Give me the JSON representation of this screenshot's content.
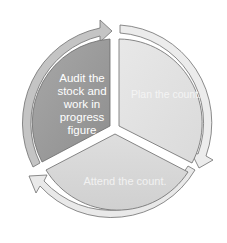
{
  "diagram": {
    "type": "cycle",
    "segments": [
      {
        "id": "audit",
        "label": "Audit the stock and work in progress figure",
        "lines": [
          "Audit the",
          "stock and",
          "work in",
          "progress",
          "figure"
        ],
        "fill": "#9c9c9c"
      },
      {
        "id": "plan",
        "label": "Plan the count.",
        "fill": "#e2e2e2"
      },
      {
        "id": "attend",
        "label": "Attend the count.",
        "fill": "#d8d8d8"
      }
    ],
    "colors": {
      "arrow_fill": "#e6e6e6",
      "arrow_fill_dark": "#bdbdbd",
      "outline": "#6e6e6e",
      "background": "#ffffff"
    }
  }
}
